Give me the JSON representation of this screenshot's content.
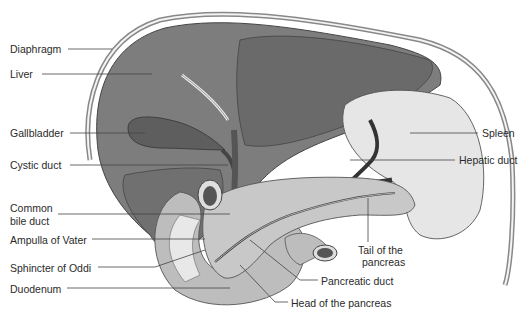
{
  "figure": {
    "type": "anatomical illustration",
    "labels": {
      "diaphragm": "Diaphragm",
      "liver": "Liver",
      "gallbladder": "Gallbladder",
      "cystic_duct": "Cystic duct",
      "common_bile_duct_1": "Common",
      "common_bile_duct_2": "bile duct",
      "ampulla": "Ampulla of Vater",
      "sphincter": "Sphincter of Oddi",
      "duodenum": "Duodenum",
      "spleen": "Spleen",
      "hepatic_duct": "Hepatic duct",
      "tail_1": "Tail of the",
      "tail_2": "pancreas",
      "pancreatic_duct": "Pancreatic duct",
      "head_pancreas": "Head of the pancreas"
    },
    "colors": {
      "liver": "#7a7a7a",
      "liver_dark": "#5e5e5e",
      "gallbladder": "#6a6a6a",
      "pancreas": "#c4c4c4",
      "duodenum": "#b8b8b8",
      "spleen": "#e2e2e2",
      "outline": "#333333",
      "leader": "#444444"
    }
  }
}
